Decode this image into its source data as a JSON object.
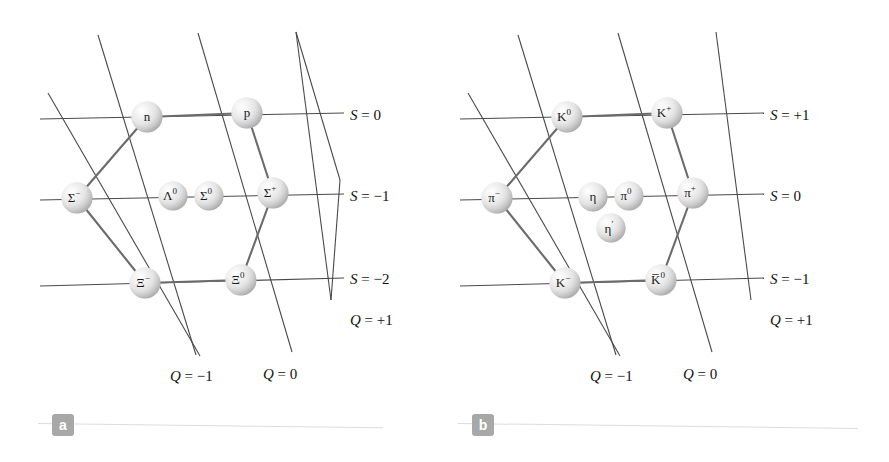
{
  "figure": {
    "type": "particle-multiplet-diagram",
    "panels": [
      {
        "id": "a",
        "badge": "a",
        "title": "baryon octet",
        "nodes": [
          {
            "name": "neutron",
            "label": "n",
            "sup": "",
            "x": 147,
            "y": 117,
            "r": 15.5,
            "q": 0,
            "s": 0
          },
          {
            "name": "proton",
            "label": "p",
            "sup": "",
            "x": 247,
            "y": 113,
            "r": 15.5,
            "q": 1,
            "s": 0
          },
          {
            "name": "sigma-minus",
            "label": "Σ",
            "sup": "−",
            "x": 77,
            "y": 198,
            "r": 15.5,
            "q": -1,
            "s": -1
          },
          {
            "name": "lambda-zero",
            "label": "Λ",
            "sup": "0",
            "x": 173,
            "y": 196,
            "r": 14.5,
            "q": 0,
            "s": -1
          },
          {
            "name": "sigma-zero",
            "label": "Σ",
            "sup": "0",
            "x": 209,
            "y": 196,
            "r": 14.5,
            "q": 0,
            "s": -1
          },
          {
            "name": "sigma-plus",
            "label": "Σ",
            "sup": "+",
            "x": 273,
            "y": 193,
            "r": 15.5,
            "q": 1,
            "s": -1
          },
          {
            "name": "xi-minus",
            "label": "Ξ",
            "sup": "−",
            "x": 145,
            "y": 283,
            "r": 15.5,
            "q": -1,
            "s": -2
          },
          {
            "name": "xi-zero",
            "label": "Ξ",
            "sup": "0",
            "x": 241,
            "y": 280,
            "r": 15.5,
            "q": 0,
            "s": -2
          }
        ],
        "s_labels": [
          {
            "text": "S = 0",
            "x": 350,
            "y": 115
          },
          {
            "text": "S = −1",
            "x": 350,
            "y": 196
          },
          {
            "text": "S = −2",
            "x": 350,
            "y": 277
          }
        ],
        "q_labels": [
          {
            "text": "Q = −1",
            "x": 170,
            "y": 375
          },
          {
            "text": "Q = 0",
            "x": 263,
            "y": 373
          },
          {
            "text": "Q = +1",
            "x": 350,
            "y": 318
          }
        ]
      },
      {
        "id": "b",
        "badge": "b",
        "title": "meson nonet",
        "nodes": [
          {
            "name": "kaon-zero",
            "label": "K",
            "sup": "0",
            "x": 123,
            "y": 117,
            "r": 15.5,
            "q": 0,
            "s": 1
          },
          {
            "name": "kaon-plus",
            "label": "K",
            "sup": "+",
            "x": 223,
            "y": 113,
            "r": 15.5,
            "q": 1,
            "s": 1
          },
          {
            "name": "pion-minus",
            "label": "π",
            "sup": "−",
            "x": 53,
            "y": 198,
            "r": 15.5,
            "q": -1,
            "s": 0
          },
          {
            "name": "eta",
            "label": "η",
            "sup": "",
            "x": 149,
            "y": 197,
            "r": 14.5,
            "q": 0,
            "s": 0
          },
          {
            "name": "pion-zero",
            "label": "π",
            "sup": "0",
            "x": 185,
            "y": 196,
            "r": 14.5,
            "q": 0,
            "s": 0
          },
          {
            "name": "pion-plus",
            "label": "π",
            "sup": "+",
            "x": 249,
            "y": 193,
            "r": 15.5,
            "q": 1,
            "s": 0
          },
          {
            "name": "eta-prime",
            "label": "η",
            "sup": "′",
            "x": 167,
            "y": 228,
            "r": 14.5,
            "q": 0,
            "s": 0
          },
          {
            "name": "kaon-minus",
            "label": "K",
            "sup": "−",
            "x": 121,
            "y": 283,
            "r": 15.5,
            "q": -1,
            "s": -1
          },
          {
            "name": "antikaon-zero",
            "label": "K̅",
            "sup": "0",
            "x": 217,
            "y": 280,
            "r": 15.5,
            "q": 0,
            "s": -1
          }
        ],
        "s_labels": [
          {
            "text": "S = +1",
            "x": 326,
            "y": 115
          },
          {
            "text": "S = 0",
            "x": 326,
            "y": 196
          },
          {
            "text": "S = −1",
            "x": 326,
            "y": 277
          }
        ],
        "q_labels": [
          {
            "text": "Q = −1",
            "x": 146,
            "y": 375
          },
          {
            "text": "Q = 0",
            "x": 239,
            "y": 373
          },
          {
            "text": "Q = +1",
            "x": 326,
            "y": 318
          }
        ]
      }
    ],
    "colors": {
      "node_fill_light": "#f2f2f2",
      "node_fill_dark": "#a9a9a9",
      "line": "#4a4a4a",
      "hex_line": "#6b6b6b",
      "text": "#111111",
      "badge_bg": "#a8a8a8",
      "badge_text": "#ffffff",
      "rule": "#dcdcdc"
    }
  }
}
